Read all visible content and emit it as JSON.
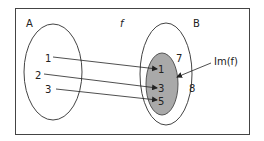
{
  "diagram": {
    "function_label": "f",
    "domain": {
      "label": "A",
      "elements": [
        "1",
        "2",
        "3"
      ]
    },
    "codomain": {
      "label": "B",
      "elements": [
        "1",
        "3",
        "5",
        "7",
        "8"
      ]
    },
    "image": {
      "label": "Im(f)",
      "elements": [
        "1",
        "3",
        "5"
      ],
      "fill_color": "#a9a9a9"
    },
    "mappings": [
      {
        "from": "1",
        "to": "1"
      },
      {
        "from": "2",
        "to": "3"
      },
      {
        "from": "3",
        "to": "5"
      }
    ]
  }
}
